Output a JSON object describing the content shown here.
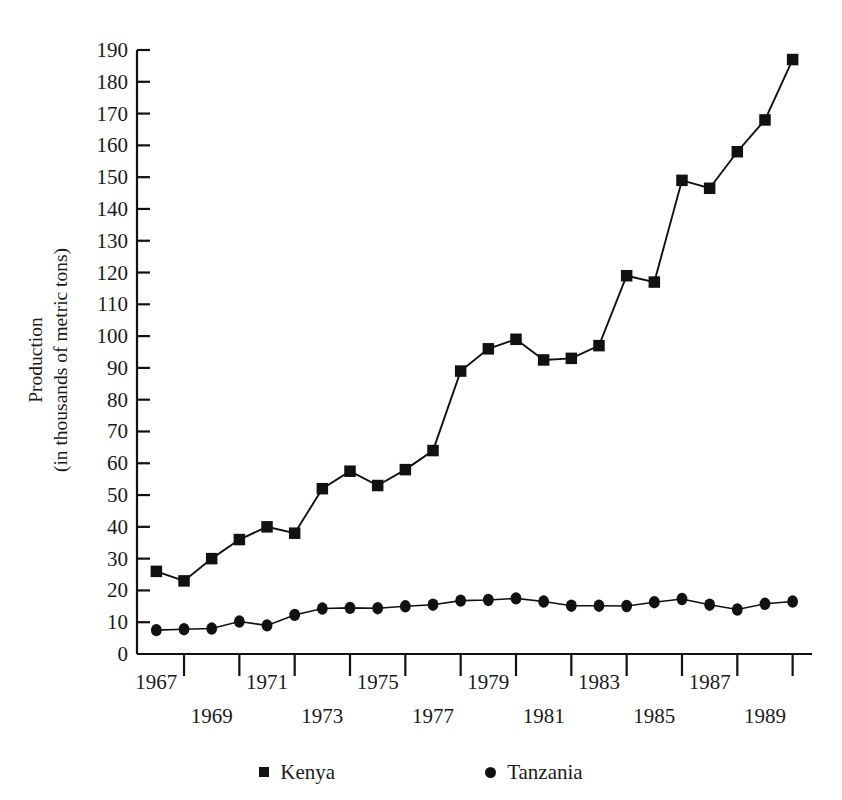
{
  "axes": {
    "ylabel_line1": "Production",
    "ylabel_line2": "(in thousands of metric tons)",
    "y_ticks": [
      "0",
      "10",
      "20",
      "30",
      "40",
      "50",
      "60",
      "70",
      "80",
      "90",
      "100",
      "110",
      "120",
      "130",
      "140",
      "150",
      "160",
      "170",
      "180",
      "190"
    ],
    "x_ticks_upper": [
      "1967",
      "1971",
      "1975",
      "1979",
      "1983",
      "1987"
    ],
    "x_ticks_lower": [
      "1969",
      "1973",
      "1977",
      "1981",
      "1985",
      "1989"
    ]
  },
  "legend": {
    "items": [
      {
        "label": "Kenya",
        "marker": "square-marker-icon",
        "color": "#111111"
      },
      {
        "label": "Tanzania",
        "marker": "circle-marker-icon",
        "color": "#111111"
      }
    ]
  },
  "chart_data": {
    "type": "line",
    "title": "",
    "xlabel": "",
    "ylabel": "Production (in thousands of metric tons)",
    "xlim": [
      1966.3,
      1990.7
    ],
    "ylim": [
      0,
      190
    ],
    "grid": false,
    "legend_position": "bottom",
    "x": [
      1967,
      1968,
      1969,
      1970,
      1971,
      1972,
      1973,
      1974,
      1975,
      1976,
      1977,
      1978,
      1979,
      1980,
      1981,
      1982,
      1983,
      1984,
      1985,
      1986,
      1987,
      1988,
      1989,
      1990
    ],
    "series": [
      {
        "name": "Kenya",
        "marker": "square",
        "color": "#111111",
        "values": [
          26,
          23,
          30,
          36,
          40,
          38,
          52,
          57.5,
          53,
          58,
          64,
          89,
          96,
          99,
          92.5,
          93,
          97,
          119,
          117,
          149,
          146.5,
          158,
          168,
          187
        ]
      },
      {
        "name": "Tanzania",
        "marker": "circle",
        "color": "#111111",
        "values": [
          7.5,
          7.8,
          8,
          10.2,
          9,
          12.3,
          14.3,
          14.5,
          14.4,
          15,
          15.5,
          16.8,
          17,
          17.5,
          16.5,
          15.2,
          15.2,
          15.1,
          16.3,
          17.3,
          15.5,
          14,
          15.8,
          16.5
        ]
      }
    ]
  }
}
